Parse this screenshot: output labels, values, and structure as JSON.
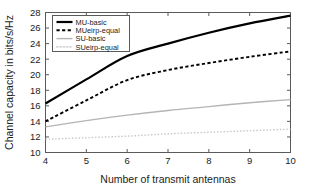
{
  "chart_data": {
    "type": "line",
    "title": "",
    "xlabel": "Number of transmit antennas",
    "ylabel": "Channel capacity in bits/s/Hz",
    "x": [
      4,
      5,
      6,
      7,
      8,
      9,
      10
    ],
    "xlim": [
      4,
      10
    ],
    "ylim": [
      10,
      28
    ],
    "xticks": [
      4,
      5,
      6,
      7,
      8,
      9,
      10
    ],
    "yticks": [
      10,
      12,
      14,
      16,
      18,
      20,
      22,
      24,
      26,
      28
    ],
    "xtick_labels": [
      "4",
      "5",
      "6",
      "7",
      "8",
      "9",
      "10"
    ],
    "ytick_labels": [
      "10",
      "12",
      "14",
      "16",
      "18",
      "20",
      "22",
      "24",
      "26",
      "28"
    ],
    "grid": false,
    "legend_position": "upper left",
    "series": [
      {
        "name": "MU-basic",
        "values": [
          16.3,
          19.4,
          22.4,
          24.0,
          25.4,
          26.6,
          27.6
        ],
        "color": "#000000",
        "style": "solid",
        "width": 2.2
      },
      {
        "name": "MUeirp-equal",
        "values": [
          14.0,
          16.7,
          19.3,
          20.6,
          21.5,
          22.3,
          23.0
        ],
        "color": "#000000",
        "style": "dashed",
        "width": 1.9
      },
      {
        "name": "SU-basic",
        "values": [
          13.3,
          14.1,
          14.8,
          15.4,
          15.9,
          16.4,
          16.8
        ],
        "color": "#b4b4b4",
        "style": "solid",
        "width": 1.4
      },
      {
        "name": "SUeirp-equal",
        "values": [
          11.7,
          11.9,
          12.1,
          12.4,
          12.6,
          12.8,
          13.0
        ],
        "color": "#c8c8c8",
        "style": "dotted",
        "width": 1.4
      }
    ]
  },
  "figure": {
    "background_color": "#ffffff",
    "axis_color": "#5a5a5a",
    "text_color": "#1c1c1c"
  }
}
